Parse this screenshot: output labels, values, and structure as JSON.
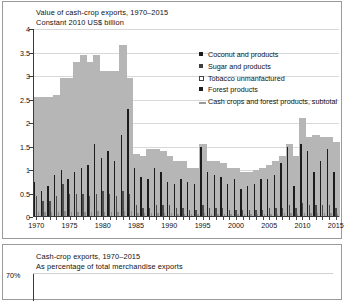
{
  "top_panel": {
    "title": "Value of cash-crop exports, 1970–2015",
    "subtitle": "Constant 2010 US$ billion"
  },
  "bottom_panel": {
    "title": "Cash-crop exports, 1970–2015",
    "subtitle": "As percentage of total merchandise exports",
    "y_top_label": "70%"
  },
  "legend": {
    "items": [
      {
        "label": "Coconut and products",
        "marker": "square-filled-dark",
        "color": "#1c1c1c"
      },
      {
        "label": "Sugar and products",
        "marker": "square-filled-mid",
        "color": "#3f3f3f"
      },
      {
        "label": "Tobacco unmanfactured",
        "marker": "square-hollow",
        "color": "#ffffff"
      },
      {
        "label": "Forest products",
        "marker": "square-filled-dark",
        "color": "#1c1c1c"
      },
      {
        "label": "Cash crops and forest products, subtotal",
        "marker": "line",
        "color": "#9a9a9a"
      }
    ]
  },
  "chart_data": {
    "type": "bar",
    "title": "Value of cash-crop exports, 1970–2015",
    "subtitle": "Constant 2010 US$ billion",
    "xlabel": "",
    "ylabel": "Constant 2010 US$ billion",
    "ylim": [
      0,
      4
    ],
    "yticks": [
      0,
      0.5,
      1,
      1.5,
      2,
      2.5,
      3,
      3.5,
      4
    ],
    "ytick_labels": [
      "0",
      "0.5",
      "1",
      "1.5",
      "2",
      "2.5",
      "3",
      "3.5",
      "4"
    ],
    "grid": true,
    "legend_position": "upper-right",
    "x": [
      1970,
      1971,
      1972,
      1973,
      1974,
      1975,
      1976,
      1977,
      1978,
      1979,
      1980,
      1981,
      1982,
      1983,
      1984,
      1985,
      1986,
      1987,
      1988,
      1989,
      1990,
      1991,
      1992,
      1993,
      1994,
      1995,
      1996,
      1997,
      1998,
      1999,
      2000,
      2001,
      2002,
      2003,
      2004,
      2005,
      2006,
      2007,
      2008,
      2009,
      2010,
      2011,
      2012,
      2013,
      2014,
      2015
    ],
    "xtick_labels": [
      "1970",
      "1975",
      "1980",
      "1985",
      "1990",
      "1995",
      "2000",
      "2005",
      "2010",
      "2015"
    ],
    "xticks": [
      1970,
      1975,
      1980,
      1985,
      1990,
      1995,
      2000,
      2005,
      2010,
      2015
    ],
    "series": [
      {
        "name": "Cash crops and forest products, subtotal",
        "type": "area",
        "color": "#b6b6b6",
        "values": [
          2.55,
          2.55,
          2.55,
          2.6,
          2.95,
          2.95,
          3.3,
          3.45,
          3.3,
          3.45,
          3.1,
          3.1,
          3.1,
          3.65,
          2.95,
          1.35,
          1.3,
          1.45,
          1.45,
          1.4,
          1.3,
          1.2,
          1.2,
          1.05,
          1.05,
          1.55,
          1.2,
          1.2,
          1.15,
          1.05,
          1.05,
          0.95,
          0.95,
          1.0,
          1.05,
          1.1,
          1.2,
          1.3,
          1.55,
          1.3,
          2.1,
          1.7,
          1.75,
          1.7,
          1.7,
          1.6
        ]
      },
      {
        "name": "Coconut and products",
        "type": "bar",
        "color": "#1c1c1c",
        "values": [
          0.75,
          0.55,
          0.65,
          0.9,
          1.0,
          0.8,
          0.95,
          1.05,
          1.1,
          1.55,
          1.25,
          1.4,
          1.2,
          1.75,
          2.3,
          1.05,
          0.85,
          0.8,
          1.05,
          0.95,
          0.75,
          0.7,
          0.8,
          0.75,
          0.7,
          1.5,
          0.95,
          0.9,
          0.85,
          0.7,
          0.8,
          0.6,
          0.65,
          0.7,
          0.8,
          0.8,
          0.9,
          1.15,
          1.5,
          0.65,
          1.55,
          1.4,
          0.95,
          1.2,
          1.45,
          0.95
        ]
      },
      {
        "name": "Sugar and products",
        "type": "bar",
        "color": "#4d4d4d",
        "values": [
          0.45,
          0.35,
          0.35,
          0.45,
          0.7,
          0.5,
          0.5,
          0.5,
          0.45,
          0.5,
          0.55,
          0.5,
          0.45,
          0.55,
          0.5,
          0.25,
          0.2,
          0.2,
          0.25,
          0.25,
          0.25,
          0.2,
          0.2,
          0.15,
          0.15,
          0.25,
          0.2,
          0.2,
          0.2,
          0.15,
          0.15,
          0.15,
          0.15,
          0.15,
          0.15,
          0.2,
          0.2,
          0.2,
          0.25,
          0.2,
          0.3,
          0.25,
          0.25,
          0.25,
          0.25,
          0.2
        ]
      },
      {
        "name": "Tobacco unmanfactured",
        "type": "bar",
        "color": "#8d8d8d",
        "values": [
          0.1,
          0.1,
          0.1,
          0.1,
          0.12,
          0.1,
          0.1,
          0.1,
          0.1,
          0.12,
          0.1,
          0.1,
          0.1,
          0.12,
          0.12,
          0.08,
          0.08,
          0.08,
          0.08,
          0.08,
          0.08,
          0.07,
          0.07,
          0.07,
          0.07,
          0.08,
          0.07,
          0.07,
          0.07,
          0.06,
          0.06,
          0.06,
          0.06,
          0.06,
          0.07,
          0.07,
          0.07,
          0.08,
          0.08,
          0.07,
          0.09,
          0.08,
          0.08,
          0.08,
          0.08,
          0.07
        ]
      }
    ]
  }
}
